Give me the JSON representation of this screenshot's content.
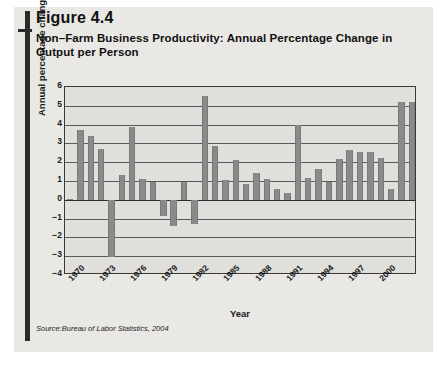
{
  "figure": {
    "number_label": "Figure 4.4",
    "title": "Non–Farm Business Productivity: Annual Percentage Change in Output per Person",
    "source": "Source:Bureau of Labor Statistics, 2004"
  },
  "colors": {
    "bar": "#8a8a8a",
    "plot_background": "#e0dfdb",
    "panel_background": "#e9e8e4",
    "rule": "#2b2b2b",
    "text": "#111111"
  },
  "chart_data": {
    "type": "bar",
    "title": "Non–Farm Business Productivity: Annual Percentage Change in Output per Person",
    "xlabel": "Year",
    "ylabel": "Annual percentage change",
    "ylim": [
      -4,
      6
    ],
    "yticks": [
      6,
      5,
      4,
      3,
      2,
      1,
      0,
      -1,
      -2,
      -3,
      -4
    ],
    "ytick_labels": [
      "6",
      "5",
      "4",
      "3",
      "2",
      "1",
      "0",
      "−1",
      "−2",
      "−3",
      "−4"
    ],
    "xtick_labels": [
      "1970",
      "1973",
      "1976",
      "1979",
      "1982",
      "1985",
      "1988",
      "1991",
      "1994",
      "1997",
      "2000"
    ],
    "xtick_years": [
      1970,
      1973,
      1976,
      1979,
      1982,
      1985,
      1988,
      1991,
      1994,
      1997,
      2000
    ],
    "grid": true,
    "legend": "none",
    "categories": [
      "1970",
      "1971",
      "1972",
      "1973",
      "1974",
      "1975",
      "1976",
      "1977",
      "1978",
      "1979",
      "1980",
      "1981",
      "1982",
      "1983",
      "1984",
      "1985",
      "1986",
      "1987",
      "1988",
      "1989",
      "1990",
      "1991",
      "1992",
      "1993",
      "1994",
      "1995",
      "1996",
      "1997",
      "1998",
      "1999",
      "2000",
      "2001",
      "2002",
      "2003"
    ],
    "values": [
      0.05,
      3.7,
      3.4,
      2.7,
      -3.05,
      1.3,
      3.85,
      1.1,
      0.95,
      -0.85,
      -1.4,
      0.95,
      -1.3,
      5.5,
      2.85,
      1.05,
      2.1,
      0.85,
      1.45,
      1.1,
      0.55,
      0.35,
      4.0,
      1.15,
      1.65,
      0.95,
      2.15,
      2.65,
      2.55,
      2.55,
      2.25,
      0.6,
      5.2,
      5.2
    ]
  }
}
